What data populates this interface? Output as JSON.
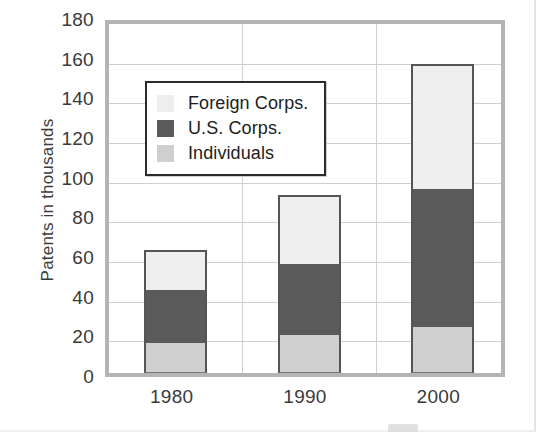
{
  "chart_data": {
    "type": "bar",
    "subtype": "stacked-bar",
    "title": "",
    "xlabel": "",
    "ylabel": "Patents in thousands",
    "categories": [
      "1980",
      "1990",
      "2000"
    ],
    "series": [
      {
        "name": "Individuals",
        "values": [
          15,
          19,
          23
        ],
        "color": "#cfcfcf"
      },
      {
        "name": "U.S. Corps.",
        "values": [
          27,
          36,
          70
        ],
        "color": "#5a5a5a"
      },
      {
        "name": "Foreign Corps.",
        "values": [
          20,
          35,
          63
        ],
        "color": "#eeeeee"
      }
    ],
    "stack_order_bottom_to_top": [
      "Individuals",
      "U.S. Corps.",
      "Foreign Corps."
    ],
    "totals": [
      62,
      90,
      156
    ],
    "ylim": [
      0,
      180
    ],
    "ytick_step": 20,
    "yticks": [
      "180",
      "160",
      "140",
      "120",
      "100",
      "80",
      "60",
      "40",
      "20",
      "0"
    ],
    "grid": true,
    "grid_axis": "both",
    "legend_position": "upper-left-inside"
  },
  "legend": {
    "entries": [
      {
        "label": "Foreign Corps.",
        "color": "#eeeeee"
      },
      {
        "label": "U.S. Corps.",
        "color": "#5a5a5a"
      },
      {
        "label": "Individuals",
        "color": "#cfcfcf"
      }
    ]
  },
  "colors": {
    "foreign_corps": "#eeeeee",
    "us_corps": "#5a5a5a",
    "individuals": "#cfcfcf",
    "plot_border": "#b4b4b4",
    "gridline": "#cfcfcf",
    "bar_outline": "#555555",
    "text": "#3a3a3a"
  }
}
